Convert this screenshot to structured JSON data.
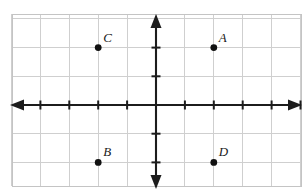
{
  "figure": {
    "width": 306,
    "height": 193,
    "background_color": "#ffffff"
  },
  "chart_data": {
    "type": "scatter",
    "title": "",
    "xlabel": "",
    "ylabel": "",
    "grid": true,
    "legend": false,
    "xlim": [
      -5,
      5
    ],
    "ylim": [
      -3,
      3
    ],
    "xticks": [
      -5,
      -4,
      -3,
      -2,
      -1,
      1,
      2,
      3,
      4,
      5
    ],
    "yticks": [
      -2,
      -1,
      1,
      2
    ],
    "xtick_labels": [],
    "ytick_labels": [],
    "axis_arrows": [
      "left",
      "right",
      "up",
      "down"
    ],
    "points": [
      {
        "label": "A",
        "x": 2,
        "y": 2,
        "label_position": "upper-right"
      },
      {
        "label": "B",
        "x": -2,
        "y": -2,
        "label_position": "upper-right"
      },
      {
        "label": "C",
        "x": -2,
        "y": 2,
        "label_position": "upper-right"
      },
      {
        "label": "D",
        "x": 2,
        "y": -2,
        "label_position": "upper-right"
      }
    ],
    "colors": {
      "point": "#111111",
      "axis": "#1c1c1c",
      "grid": "#cfcfcf",
      "border": "#c4c4c4",
      "label": "#1a1a1a"
    }
  },
  "geometry": {
    "origin_px": {
      "x": 156,
      "y": 105
    },
    "unit_px": {
      "x": 28.9,
      "y": 28.7
    },
    "grid_bounds_px": {
      "left": 12,
      "top": 14,
      "right": 301,
      "bottom": 186
    }
  },
  "labels": {
    "a": "A",
    "b": "B",
    "c": "C",
    "d": "D"
  }
}
